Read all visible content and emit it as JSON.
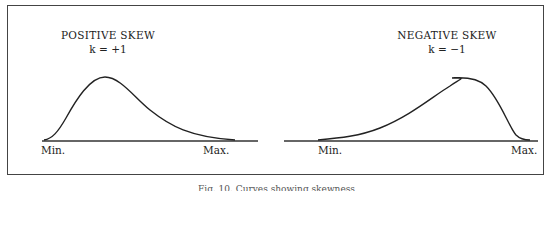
{
  "figure": {
    "caption": "Fig. 10.  Curves showing skewness"
  },
  "panels": [
    {
      "title": "POSITIVE SKEW",
      "k_label": "k = +1",
      "min_label": "Min.",
      "max_label": "Max."
    },
    {
      "title": "NEGATIVE SKEW",
      "k_label": "k = −1",
      "min_label": "Min.",
      "max_label": "Max."
    }
  ],
  "colors": {
    "ink": "#222222",
    "frame": "#444444",
    "background": "#ffffff"
  }
}
